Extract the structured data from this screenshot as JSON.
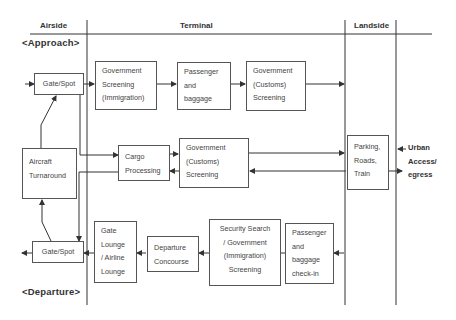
{
  "zones": {
    "airside": "Airside",
    "terminal": "Terminal",
    "landside": "Landside"
  },
  "phases": {
    "approach": "<Approach>",
    "departure": "<Departure>"
  },
  "boxes": {
    "gate_spot_arrival": "Gate/Spot",
    "gov_screening_immigration": "Government\nScreening\n(Immigration)",
    "passenger_baggage": "Passenger\nand\nbaggage",
    "gov_customs_arrival": "Government\n(Customs)\nScreening",
    "aircraft_turnaround": "Aircraft\nTurnaround",
    "cargo_processing": "Cargo\nProcessing",
    "gov_customs_cargo": "Government\n(Customs)\nScreening",
    "parking_roads_train": "Parking,\nRoads,\nTrain",
    "gate_spot_departure": "Gate/Spot",
    "gate_lounge": "Gate\nLounge\n/ Airline\nLounge",
    "departure_concourse": "Departure\nConcourse",
    "security_search": "Security Search\n/ Government\n(Immigration)\nScreening",
    "passenger_checkin": "Passenger\nand\nbaggage\ncheck-in"
  },
  "external": {
    "urban_access": "Urban\nAccess/\negress"
  },
  "colors": {
    "line": "#333333",
    "box_border": "#555555",
    "text": "#444444"
  }
}
